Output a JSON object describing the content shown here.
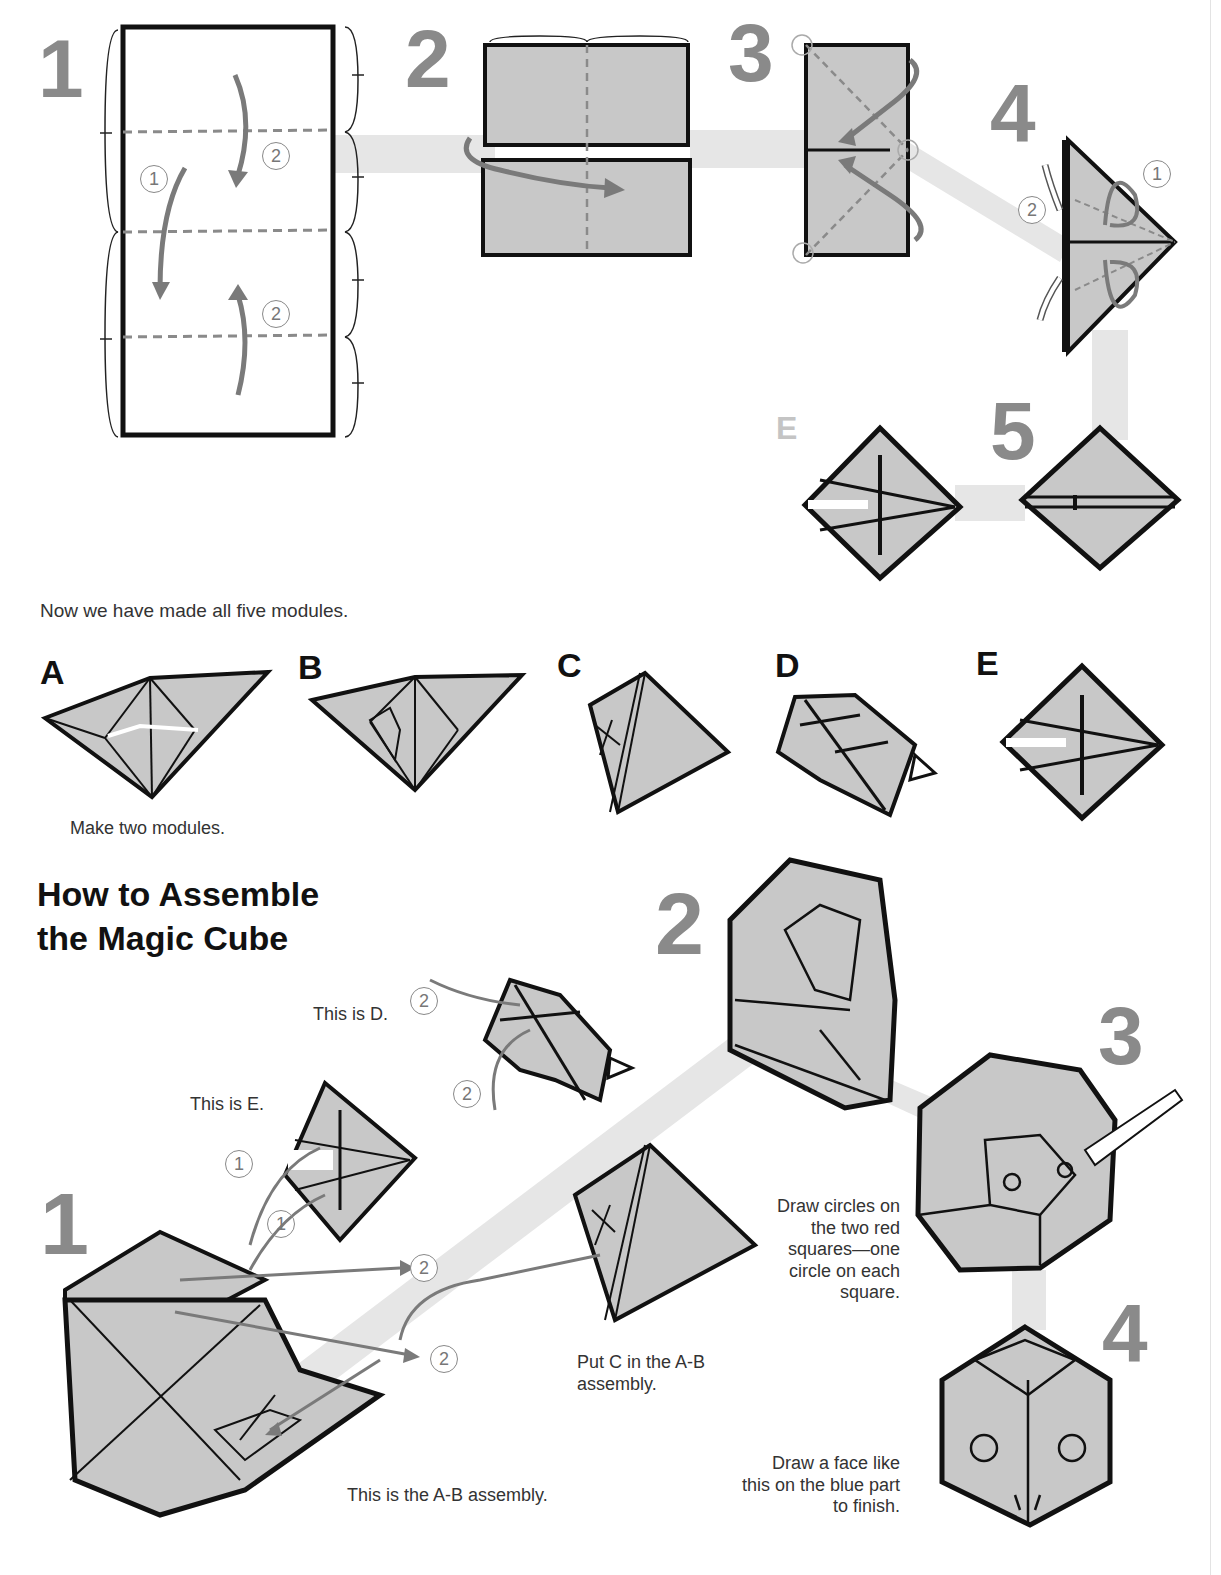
{
  "folding_steps": {
    "step_numbers": [
      "1",
      "2",
      "3",
      "4",
      "5"
    ],
    "fold_order_markers": [
      "1",
      "2",
      "2",
      "2",
      "1",
      "2"
    ],
    "module_label_small": "E"
  },
  "modules_section": {
    "intro": "Now we have made all five modules.",
    "modules": [
      {
        "label": "A",
        "note": "Make two modules."
      },
      {
        "label": "B",
        "note": ""
      },
      {
        "label": "C",
        "note": ""
      },
      {
        "label": "D",
        "note": ""
      },
      {
        "label": "E",
        "note": ""
      }
    ]
  },
  "assembly": {
    "heading_line1": "How to Assemble",
    "heading_line2": "the Magic Cube",
    "step_numbers": [
      "1",
      "2",
      "3",
      "4"
    ],
    "captions": {
      "this_is_d": "This is D.",
      "this_is_e": "This is E.",
      "ab_assembly": "This is the A-B assembly.",
      "put_c": "Put C in the A-B assembly.",
      "draw_circles": "Draw circles on the two red squares—one circle on each square.",
      "draw_face": "Draw a face like this on the blue part to finish."
    },
    "markers": [
      "2",
      "2",
      "1",
      "1",
      "2",
      "2"
    ]
  },
  "colors": {
    "paper_fill": "#c8c8c8",
    "outline": "#111111",
    "step_number": "#8a8a8a",
    "arrow": "#7a7a7a",
    "path_band": "#e6e6e6"
  }
}
